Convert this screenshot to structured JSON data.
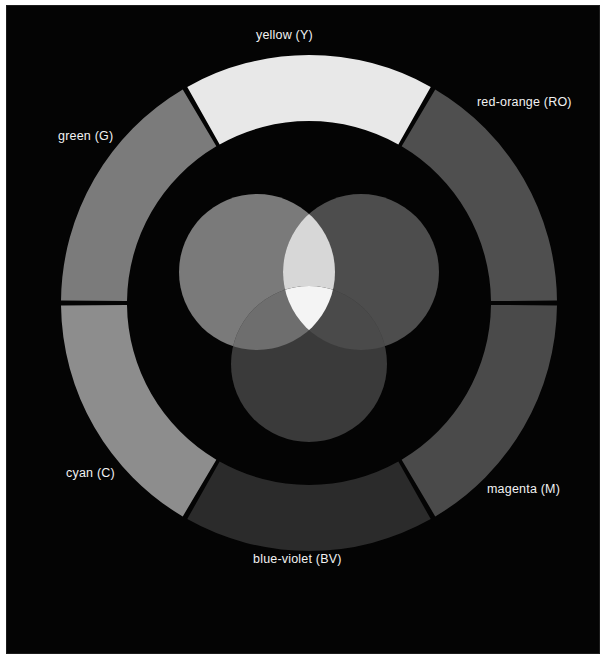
{
  "figure": {
    "background_color": "#040404",
    "page_color": "#ffffff",
    "label_color": "#f2f2f2"
  },
  "wheel": {
    "name": "six-segment-color-ring",
    "center": {
      "x": 248,
      "y": 248
    },
    "outer_radius": 248,
    "inner_radius": 182,
    "gap_degrees": 1.2,
    "segments": [
      {
        "id": "yellow",
        "label": "yellow (Y)",
        "abbr": "Y",
        "start_deg": -30,
        "end_deg": 30,
        "gray_hex": "#e8e8e8",
        "true_color_hex": "#ffff00"
      },
      {
        "id": "red-orange",
        "label": "red-orange (RO)",
        "abbr": "RO",
        "start_deg": 30,
        "end_deg": 90,
        "gray_hex": "#4f4f4f",
        "true_color_hex": "#ff3b00"
      },
      {
        "id": "magenta",
        "label": "magenta (M)",
        "abbr": "M",
        "start_deg": 90,
        "end_deg": 150,
        "gray_hex": "#4a4a4a",
        "true_color_hex": "#ff00ff"
      },
      {
        "id": "blue-violet",
        "label": "blue-violet (BV)",
        "abbr": "BV",
        "start_deg": 150,
        "end_deg": 210,
        "gray_hex": "#2b2b2b",
        "true_color_hex": "#3a12c8"
      },
      {
        "id": "cyan",
        "label": "cyan (C)",
        "abbr": "C",
        "start_deg": 210,
        "end_deg": 270,
        "gray_hex": "#8d8d8d",
        "true_color_hex": "#00ffff"
      },
      {
        "id": "green",
        "label": "green (G)",
        "abbr": "G",
        "start_deg": 270,
        "end_deg": 330,
        "gray_hex": "#7b7b7b",
        "true_color_hex": "#00c000"
      }
    ]
  },
  "venn": {
    "name": "additive-primary-venn",
    "circle_radius": 78,
    "circles": [
      {
        "id": "green-circle",
        "cx": 78,
        "cy": 82,
        "gray_hex": "#7a7a7a",
        "primary": "green"
      },
      {
        "id": "red-circle",
        "cx": 182,
        "cy": 82,
        "gray_hex": "#4d4d4d",
        "primary": "red"
      },
      {
        "id": "blue-circle",
        "cx": 130,
        "cy": 174,
        "gray_hex": "#3a3a3a",
        "primary": "blue"
      }
    ],
    "overlaps": [
      {
        "id": "green-red-overlap",
        "mix": "yellow",
        "gray_hex": "#d7d7d7"
      },
      {
        "id": "green-blue-overlap",
        "mix": "cyan",
        "gray_hex": "#6e6e6e"
      },
      {
        "id": "red-blue-overlap",
        "mix": "magenta",
        "gray_hex": "#4a4a4a"
      },
      {
        "id": "center-overlap",
        "mix": "white",
        "gray_hex": "#f4f4f4"
      }
    ]
  },
  "labels": {
    "yellow": "yellow (Y)",
    "red_orange": "red-orange (RO)",
    "green": "green (G)",
    "cyan": "cyan (C)",
    "magenta": "magenta (M)",
    "blue_violet": "blue-violet (BV)"
  }
}
